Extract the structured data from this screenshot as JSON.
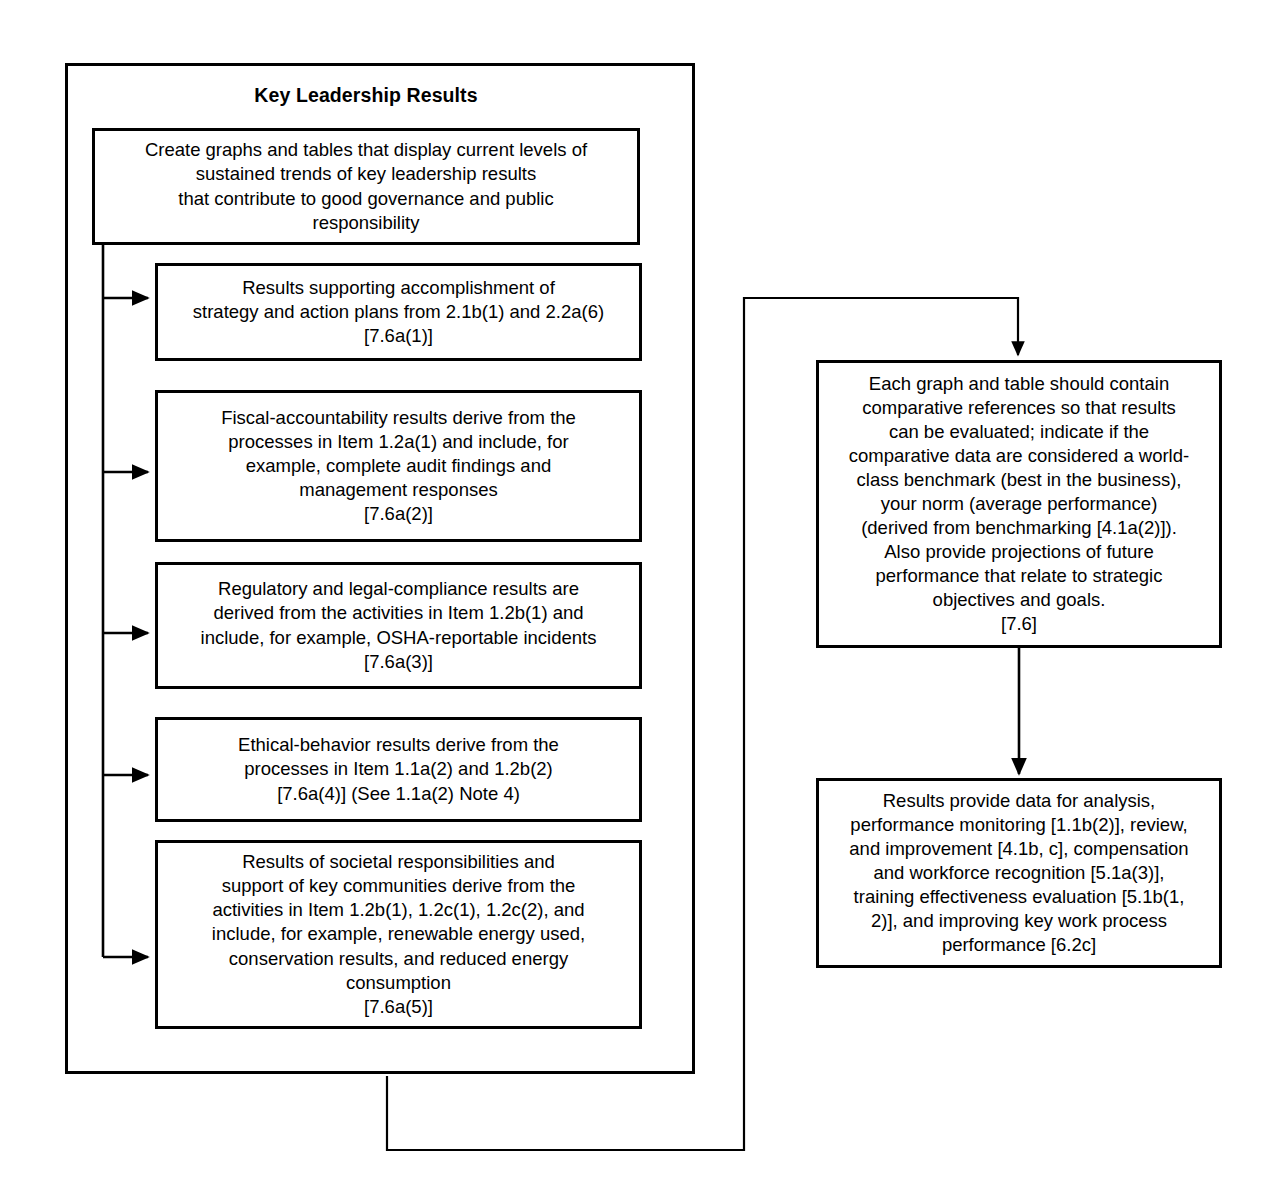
{
  "diagram": {
    "title": "Key Leadership Results",
    "nodes": {
      "create": "Create graphs and tables that display current levels of sustained trends of key leadership results\nthat contribute to good governance and public responsibility",
      "strategy": "Results supporting accomplishment of strategy and action plans from 2.1b(1) and 2.2a(6) [7.6a(1)]",
      "fiscal": "Fiscal-accountability results derive from the processes in Item 1.2a(1) and include, for example, complete audit findings and management responses [7.6a(2)]",
      "regulatory": "Regulatory and legal-compliance results are derived from the activities in Item 1.2b(1) and include, for example, OSHA-reportable incidents [7.6a(3)]",
      "ethical": "Ethical-behavior results derive from the processes in Item 1.1a(2) and 1.2b(2) [7.6a(4)] (See 1.1a(2) Note 4)",
      "societal": "Results of societal responsibilities and support of key communities derive from the activities in Item 1.2b(1), 1.2c(1), 1.2c(2), and include, for example, renewable energy used, conservation results, and reduced energy consumption [7.6a(5)]",
      "comparative": "Each graph and table should contain comparative references so that results can be evaluated; indicate if the comparative data are considered a world-class benchmark (best in the business), your norm (average performance) (derived from benchmarking [4.1a(2)]). Also provide projections of future performance that relate to strategic objectives and goals. [7.6]",
      "analysis": "Results provide data for analysis, performance monitoring [1.1b(2)], review, and improvement [4.1b, c], compensation and workforce recognition [5.1a(3)], training effectiveness evaluation [5.1b(1, 2)], and improving key work process performance [6.2c]"
    },
    "node_lines": {
      "create": [
        "Create graphs and tables that display current levels of",
        "sustained trends of key leadership results",
        "that contribute to good governance and public",
        "responsibility"
      ],
      "strategy": [
        "Results supporting accomplishment of",
        "strategy and action plans from 2.1b(1) and 2.2a(6)",
        "[7.6a(1)]"
      ],
      "fiscal": [
        "Fiscal-accountability results derive from the",
        "processes in Item 1.2a(1) and include, for",
        "example, complete audit findings and",
        "management responses",
        "[7.6a(2)]"
      ],
      "regulatory": [
        "Regulatory and legal-compliance results are",
        "derived from the activities in Item 1.2b(1) and",
        "include, for example, OSHA-reportable incidents",
        "[7.6a(3)]"
      ],
      "ethical": [
        "Ethical-behavior results derive from the",
        "processes in Item 1.1a(2) and 1.2b(2)",
        "[7.6a(4)] (See 1.1a(2) Note 4)"
      ],
      "societal": [
        "Results of societal responsibilities and",
        "support of key communities derive from the",
        "activities in Item 1.2b(1), 1.2c(1), 1.2c(2), and",
        "include, for example, renewable energy used,",
        "conservation results, and reduced energy",
        "consumption",
        "[7.6a(5)]"
      ],
      "comparative": [
        "Each graph and table should contain",
        "comparative references so that results",
        "can be evaluated; indicate if the",
        "comparative data are considered a world-",
        "class benchmark (best in the business),",
        "your norm (average performance)",
        "(derived from benchmarking [4.1a(2)]).",
        "Also provide projections of future",
        "performance that relate to strategic",
        "objectives and goals.",
        "[7.6]"
      ],
      "analysis": [
        "Results provide data for analysis,",
        "performance monitoring [1.1b(2)], review,",
        "and improvement [4.1b, c], compensation",
        "and workforce recognition [5.1a(3)],",
        "training effectiveness evaluation [5.1b(1,",
        "2)], and improving key work process",
        "performance [6.2c]"
      ]
    },
    "colors": {
      "stroke": "#000000",
      "background": "#ffffff",
      "text": "#000000"
    }
  }
}
